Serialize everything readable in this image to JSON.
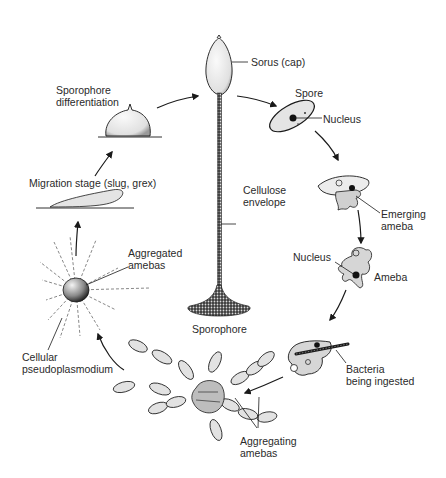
{
  "diagram": {
    "type": "life-cycle",
    "labels": {
      "sorus": "Sorus (cap)",
      "spore": "Spore",
      "spore_nucleus": "Nucleus",
      "cellulose_1": "Cellulose",
      "cellulose_2": "envelope",
      "emerging_1": "Emerging",
      "emerging_2": "ameba",
      "ameba_nucleus": "Nucleus",
      "ameba": "Ameba",
      "bacteria_1": "Bacteria",
      "bacteria_2": "being ingested",
      "aggregating_1": "Aggregating",
      "aggregating_2": "amebas",
      "sporophore": "Sporophore",
      "pseudo_1": "Cellular",
      "pseudo_2": "pseudoplasmodium",
      "aggregated_1": "Aggregated",
      "aggregated_2": "amebas",
      "migration": "Migration stage (slug, grex)",
      "sporediff_1": "Sporophore",
      "sporediff_2": "differentiation"
    },
    "stages": [
      "Sporophore differentiation",
      "Sorus (cap) on Sporophore",
      "Spore",
      "Emerging ameba",
      "Ameba",
      "Bacteria being ingested",
      "Aggregating amebas",
      "Cellular pseudoplasmodium",
      "Migration stage (slug, grex)"
    ],
    "colors": {
      "ink": "#1a1a1a",
      "fill_light": "#e8e8e8",
      "fill_mid": "#c8c8c8",
      "text": "#2a2a2a"
    }
  }
}
